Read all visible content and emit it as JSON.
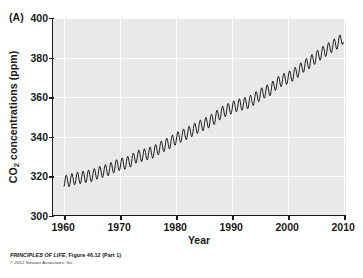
{
  "figure": {
    "panel_label": "(A)",
    "credit_title": "PRINCIPLES OF LIFE,",
    "credit_figure": "Figure 46.12 (Part 1)",
    "copyright": "© 2012 Sinauer Associates, Inc."
  },
  "colors": {
    "plot_background": "#e9e9e9",
    "gridline": "#fdfdfd",
    "axis": "#1a1a1a",
    "data_line": "#1a1a1a",
    "page_background": "#ffffff",
    "text": "#1a1a1a"
  },
  "chart_data": {
    "type": "line",
    "title": "",
    "subtitle": "",
    "xlabel": "Year",
    "ylabel": "CO2 concentrations (ppm)",
    "ylabel_html": "CO<sub>2</sub> concentrations (ppm)",
    "xlim": [
      1958,
      2010.5
    ],
    "ylim": [
      300,
      400
    ],
    "xticks": [
      1960,
      1970,
      1980,
      1990,
      2000,
      2010
    ],
    "xticklabels": [
      "1960",
      "1970",
      "1980",
      "1990",
      "2000",
      "2010"
    ],
    "yticks": [
      300,
      320,
      340,
      360,
      380,
      400
    ],
    "yticklabels": [
      "300",
      "320",
      "340",
      "360",
      "380",
      "400"
    ],
    "grid": true,
    "grid_color": "#ffffff",
    "legend": null,
    "legend_position": "none",
    "annotations": [],
    "series": [
      {
        "name": "Atmospheric CO2 concentration (Mauna Loa, monthly)",
        "line_color": "#1a1a1a",
        "line_width": 1.0,
        "description": "Keeling Curve: rising trend with annual sawtooth seasonal oscillation of about 6 ppm peak-to-trough",
        "seasonal_amplitude_ppm": 3.1,
        "annual_mean": {
          "x": [
            1960,
            1961,
            1962,
            1963,
            1964,
            1965,
            1966,
            1967,
            1968,
            1969,
            1970,
            1971,
            1972,
            1973,
            1974,
            1975,
            1976,
            1977,
            1978,
            1979,
            1980,
            1981,
            1982,
            1983,
            1984,
            1985,
            1986,
            1987,
            1988,
            1989,
            1990,
            1991,
            1992,
            1993,
            1994,
            1995,
            1996,
            1997,
            1998,
            1999,
            2000,
            2001,
            2002,
            2003,
            2004,
            2005,
            2006,
            2007,
            2008,
            2009,
            2010
          ],
          "y": [
            316.9,
            317.6,
            318.5,
            319.0,
            319.6,
            320.0,
            321.4,
            322.2,
            323.0,
            324.6,
            325.7,
            326.3,
            327.5,
            329.7,
            330.2,
            331.1,
            332.0,
            333.8,
            335.4,
            336.8,
            338.7,
            340.1,
            341.4,
            343.0,
            344.6,
            346.0,
            347.4,
            349.2,
            351.6,
            353.1,
            354.4,
            355.6,
            356.4,
            357.1,
            358.8,
            360.8,
            362.6,
            363.7,
            366.7,
            368.4,
            369.5,
            371.1,
            373.2,
            375.8,
            377.5,
            379.8,
            381.9,
            383.8,
            385.6,
            387.4,
            389.9
          ]
        }
      }
    ]
  }
}
